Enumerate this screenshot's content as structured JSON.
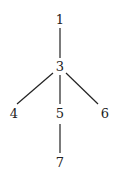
{
  "diagram": {
    "type": "tree",
    "nodes": [
      {
        "id": "1",
        "label": "1"
      },
      {
        "id": "3",
        "label": "3"
      },
      {
        "id": "4",
        "label": "4"
      },
      {
        "id": "5",
        "label": "5"
      },
      {
        "id": "6",
        "label": "6"
      },
      {
        "id": "7",
        "label": "7"
      }
    ],
    "edges": [
      {
        "from": "1",
        "to": "3"
      },
      {
        "from": "3",
        "to": "4"
      },
      {
        "from": "3",
        "to": "5"
      },
      {
        "from": "3",
        "to": "6"
      },
      {
        "from": "5",
        "to": "7"
      }
    ]
  }
}
